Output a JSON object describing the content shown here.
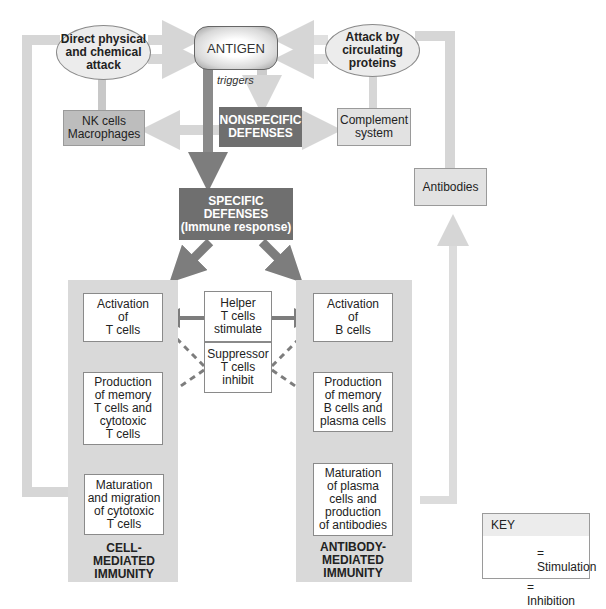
{
  "diagram": {
    "antigen": "ANTIGEN",
    "triggers_label": "triggers",
    "direct_attack": [
      "Direct physical",
      "and chemical",
      "attack"
    ],
    "circulating_attack": [
      "Attack by",
      "circulating",
      "proteins"
    ],
    "nk_cells": [
      "NK cells",
      "Macrophages"
    ],
    "nonspecific": [
      "NONSPECIFIC",
      "DEFENSES"
    ],
    "complement": [
      "Complement",
      "system"
    ],
    "antibodies": "Antibodies",
    "specific": [
      "SPECIFIC",
      "DEFENSES",
      "(Immune response)"
    ],
    "cell_mediated": {
      "steps": [
        [
          "Activation",
          "of",
          "T cells"
        ],
        [
          "Production",
          "of memory",
          "T cells and",
          "cytotoxic",
          "T cells"
        ],
        [
          "Maturation",
          "and migration",
          "of cytotoxic",
          "T cells"
        ]
      ],
      "caption": [
        "CELL-",
        "MEDIATED",
        "IMMUNITY"
      ]
    },
    "antibody_mediated": {
      "steps": [
        [
          "Activation",
          "of",
          "B cells"
        ],
        [
          "Production",
          "of memory",
          "B cells and",
          "plasma cells"
        ],
        [
          "Maturation",
          "of plasma",
          "cells and",
          "production",
          "of antibodies"
        ]
      ],
      "caption": [
        "ANTIBODY-",
        "MEDIATED",
        "IMMUNITY"
      ]
    },
    "helper": [
      "Helper",
      "T cells",
      "stimulate"
    ],
    "suppressor": [
      "Suppressor",
      "T cells",
      "inhibit"
    ]
  },
  "key": {
    "title": "KEY",
    "stimulation": "= Stimulation",
    "inhibition": "= Inhibition"
  },
  "colors": {
    "light_arrow": "#d6d6d6",
    "dark_arrow": "#7d7d7d",
    "panel": "#d9d9d9",
    "dark_box": "#6f6f6f"
  }
}
